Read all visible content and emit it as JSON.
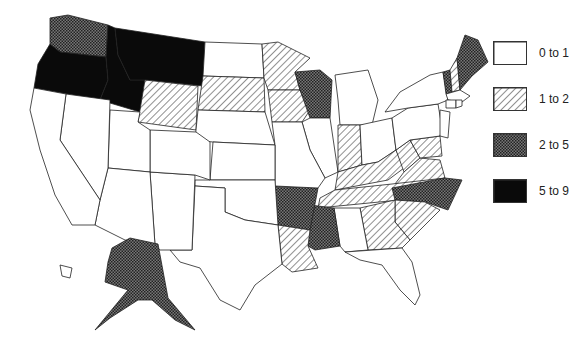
{
  "legend": {
    "items": [
      {
        "label": "0 to 1",
        "category": "c0"
      },
      {
        "label": "1 to 2",
        "category": "c1"
      },
      {
        "label": "2 to 5",
        "category": "c2"
      },
      {
        "label": "5 to 9",
        "category": "c3"
      }
    ]
  },
  "styles": {
    "c0": {
      "fill": "#ffffff",
      "pattern": "none"
    },
    "c1": {
      "fill": "url(#hatch)",
      "pattern": "diagonal-hatch"
    },
    "c2": {
      "fill": "url(#cross)",
      "pattern": "cross-hatch"
    },
    "c3": {
      "fill": "#0a0a0a",
      "pattern": "solid-black"
    }
  },
  "states": [
    {
      "name": "Washington",
      "category": "c2",
      "points": "50,18 68,15 108,25 106,57 60,52 50,44"
    },
    {
      "name": "Oregon",
      "category": "c3",
      "points": "50,44 60,52 106,57 108,80 100,100 34,88 38,64"
    },
    {
      "name": "Idaho",
      "category": "c3",
      "points": "108,25 115,28 118,55 130,80 145,80 140,112 100,100 108,80 106,57"
    },
    {
      "name": "Montana",
      "category": "c3",
      "points": "115,28 205,42 203,86 145,80 130,80 118,55"
    },
    {
      "name": "Wyoming",
      "category": "c1",
      "points": "145,80 198,86 196,130 138,122"
    },
    {
      "name": "North Dakota",
      "category": "c0",
      "points": "205,42 262,44 264,78 203,76"
    },
    {
      "name": "South Dakota",
      "category": "c1",
      "points": "203,76 264,78 265,112 198,110"
    },
    {
      "name": "Nebraska",
      "category": "c0",
      "points": "198,110 265,112 275,145 213,142 195,140 196,130"
    },
    {
      "name": "Minnesota",
      "category": "c1",
      "points": "262,44 278,42 310,58 295,72 300,90 268,90 264,78"
    },
    {
      "name": "Iowa",
      "category": "c1",
      "points": "268,90 300,90 310,110 302,122 272,122"
    },
    {
      "name": "Wisconsin",
      "category": "c2",
      "points": "295,72 320,70 332,80 330,118 310,118 300,90"
    },
    {
      "name": "Illinois",
      "category": "c0",
      "points": "310,118 330,118 338,172 325,178 310,150 302,122"
    },
    {
      "name": "Michigan",
      "category": "c0",
      "points": "335,75 368,70 378,100 372,125 340,125 338,100"
    },
    {
      "name": "Indiana",
      "category": "c1",
      "points": "338,125 360,125 362,165 338,172"
    },
    {
      "name": "Ohio",
      "category": "c0",
      "points": "360,125 392,118 396,150 378,162 362,165"
    },
    {
      "name": "Kentucky",
      "category": "c1",
      "points": "338,172 362,165 378,162 396,150 404,168 388,180 335,190"
    },
    {
      "name": "West Virginia",
      "category": "c1",
      "points": "396,150 410,140 420,158 404,172"
    },
    {
      "name": "Virginia",
      "category": "c1",
      "points": "404,172 420,158 440,160 445,178 392,188"
    },
    {
      "name": "Maryland",
      "category": "c1",
      "points": "410,140 440,136 442,156 420,158"
    },
    {
      "name": "Tennessee",
      "category": "c1",
      "points": "320,198 335,190 392,184 445,178 420,198 318,208"
    },
    {
      "name": "North Carolina",
      "category": "c2",
      "points": "392,188 445,178 462,180 448,210 425,202 395,200"
    },
    {
      "name": "South Carolina",
      "category": "c1",
      "points": "395,200 425,202 440,210 410,240 395,222"
    },
    {
      "name": "Georgia",
      "category": "c1",
      "points": "360,208 395,200 395,222 410,240 402,248 368,250"
    },
    {
      "name": "Alabama",
      "category": "c0",
      "points": "334,208 360,208 368,250 345,252 340,246"
    },
    {
      "name": "Mississippi",
      "category": "c2",
      "points": "310,205 334,208 340,246 315,250 308,246"
    },
    {
      "name": "Arkansas",
      "category": "c2",
      "points": "275,186 318,188 310,230 278,225"
    },
    {
      "name": "Louisiana",
      "category": "c1",
      "points": "278,225 310,230 308,246 318,268 292,272 282,264"
    },
    {
      "name": "Florida",
      "category": "c0",
      "points": "345,252 402,248 412,262 420,295 415,305 400,290 382,265 360,260"
    },
    {
      "name": "Missouri",
      "category": "c0",
      "points": "272,122 302,122 310,150 325,178 318,188 275,186 275,145"
    },
    {
      "name": "Kansas",
      "category": "c0",
      "points": "213,142 275,145 275,180 210,180"
    },
    {
      "name": "Oklahoma",
      "category": "c0",
      "points": "195,180 275,180 278,225 245,220 225,212 225,188 195,186"
    },
    {
      "name": "Texas",
      "category": "c0",
      "points": "195,186 225,188 225,212 245,220 278,225 282,264 255,285 240,310 220,300 200,268 180,262 170,250 192,250"
    },
    {
      "name": "New Mexico",
      "category": "c0",
      "points": "150,172 195,175 192,250 160,250 155,245"
    },
    {
      "name": "Colorado",
      "category": "c0",
      "points": "150,130 196,132 210,142 210,180 195,175 150,172"
    },
    {
      "name": "Utah",
      "category": "c0",
      "points": "110,110 140,112 138,122 150,130 150,172 108,168"
    },
    {
      "name": "Arizona",
      "category": "c0",
      "points": "108,168 150,172 155,245 125,240 95,225 100,200"
    },
    {
      "name": "Nevada",
      "category": "c0",
      "points": "66,94 110,100 108,168 100,200 60,140"
    },
    {
      "name": "California",
      "category": "c0",
      "points": "34,88 66,94 60,140 100,200 95,225 72,225 55,195 40,150 30,110"
    },
    {
      "name": "Pennsylvania",
      "category": "c0",
      "points": "392,118 408,108 438,104 442,128 440,136 410,140 396,150"
    },
    {
      "name": "New York",
      "category": "c0",
      "points": "385,112 400,92 430,75 443,72 448,100 438,104 408,108"
    },
    {
      "name": "New Jersey",
      "category": "c0",
      "points": "440,110 450,112 448,138 440,136"
    },
    {
      "name": "Vermont",
      "category": "c2",
      "points": "443,72 450,70 452,92 446,94"
    },
    {
      "name": "New Hampshire",
      "category": "c1",
      "points": "450,70 457,58 460,90 452,92"
    },
    {
      "name": "Maine",
      "category": "c2",
      "points": "457,58 465,35 478,40 488,62 472,76 460,90"
    },
    {
      "name": "Massachusetts",
      "category": "c0",
      "points": "446,94 460,90 470,96 462,102 448,100"
    },
    {
      "name": "Connecticut",
      "category": "c0",
      "points": "446,100 456,100 456,108 446,108"
    },
    {
      "name": "Rhode Island",
      "category": "c0",
      "points": "456,100 462,100 462,106 456,108"
    },
    {
      "name": "Alaska",
      "category": "c2",
      "points": "112,248 130,238 158,244 168,298 195,330 175,320 152,300 138,300 110,318 95,330 128,290 105,282 108,262"
    },
    {
      "name": "Hawaii",
      "category": "c0",
      "points": "60,265 72,268 70,278 62,276"
    }
  ]
}
